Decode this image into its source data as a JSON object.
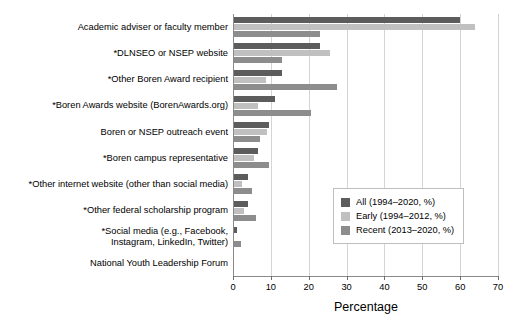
{
  "chart_data": {
    "type": "bar",
    "orientation": "horizontal",
    "title": "",
    "xlabel": "Percentage",
    "ylabel": "",
    "xlim": [
      0,
      70
    ],
    "xticks": [
      0,
      10,
      20,
      30,
      40,
      50,
      60,
      70
    ],
    "grid": true,
    "grid_axis": "x",
    "legend_position": "center right",
    "categories": [
      "Academic adviser or faculty member",
      "*DLNSEO or NSEP website",
      "*Other Boren Award recipient",
      "*Boren Awards website (BorenAwards.org)",
      "Boren or NSEP outreach event",
      "*Boren campus representative",
      "*Other internet website (other than social media)",
      "*Other federal scholarship program",
      "*Social media (e.g., Facebook,\nInstagram, LinkedIn, Twitter)",
      "National Youth Leadership Forum"
    ],
    "series": [
      {
        "name": "All (1994–2020, %)",
        "color": "#5c5c5c",
        "values": [
          60.0,
          23.0,
          13.0,
          11.0,
          9.5,
          6.5,
          4.0,
          4.0,
          1.0,
          0.0
        ]
      },
      {
        "name": "Early (1994–2012, %)",
        "color": "#c0c0c0",
        "values": [
          64.0,
          25.5,
          8.7,
          6.5,
          9.0,
          5.5,
          2.5,
          3.0,
          0.0,
          0.0
        ]
      },
      {
        "name": "Recent (2013–2020, %)",
        "color": "#8d8d8d",
        "values": [
          23.0,
          13.0,
          27.5,
          20.5,
          7.0,
          9.5,
          5.0,
          6.0,
          2.0,
          0.0
        ]
      }
    ]
  }
}
